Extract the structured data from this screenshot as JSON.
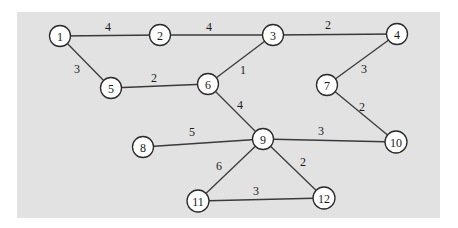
{
  "diagram": {
    "type": "weighted-undirected-graph",
    "colors": {
      "background": "#e2e2e2",
      "node_fill": "#ffffff",
      "stroke": "#2a2a2a"
    },
    "nodes": [
      {
        "id": "1",
        "label": "1",
        "x": 60,
        "y": 36
      },
      {
        "id": "2",
        "label": "2",
        "x": 160,
        "y": 35
      },
      {
        "id": "3",
        "label": "3",
        "x": 273,
        "y": 35
      },
      {
        "id": "4",
        "label": "4",
        "x": 397,
        "y": 34
      },
      {
        "id": "5",
        "label": "5",
        "x": 111,
        "y": 88
      },
      {
        "id": "6",
        "label": "6",
        "x": 208,
        "y": 84
      },
      {
        "id": "7",
        "label": "7",
        "x": 327,
        "y": 85
      },
      {
        "id": "8",
        "label": "8",
        "x": 143,
        "y": 147
      },
      {
        "id": "9",
        "label": "9",
        "x": 263,
        "y": 139
      },
      {
        "id": "10",
        "label": "10",
        "x": 396,
        "y": 142
      },
      {
        "id": "11",
        "label": "11",
        "x": 198,
        "y": 201
      },
      {
        "id": "12",
        "label": "12",
        "x": 324,
        "y": 198
      }
    ],
    "edges": [
      {
        "from": "1",
        "to": "2",
        "weight": "4",
        "lx": 108,
        "ly": 27
      },
      {
        "from": "2",
        "to": "3",
        "weight": "4",
        "lx": 209,
        "ly": 27
      },
      {
        "from": "3",
        "to": "4",
        "weight": "2",
        "lx": 328,
        "ly": 25
      },
      {
        "from": "1",
        "to": "5",
        "weight": "3",
        "lx": 77,
        "ly": 69
      },
      {
        "from": "5",
        "to": "6",
        "weight": "2",
        "lx": 154,
        "ly": 78
      },
      {
        "from": "6",
        "to": "3",
        "weight": "1",
        "lx": 243,
        "ly": 70
      },
      {
        "from": "4",
        "to": "7",
        "weight": "3",
        "lx": 364,
        "ly": 69
      },
      {
        "from": "7",
        "to": "10",
        "weight": "2",
        "lx": 362,
        "ly": 107
      },
      {
        "from": "6",
        "to": "9",
        "weight": "4",
        "lx": 240,
        "ly": 105
      },
      {
        "from": "8",
        "to": "9",
        "weight": "5",
        "lx": 192,
        "ly": 132
      },
      {
        "from": "9",
        "to": "10",
        "weight": "3",
        "lx": 321,
        "ly": 131
      },
      {
        "from": "9",
        "to": "11",
        "weight": "6",
        "lx": 219,
        "ly": 166
      },
      {
        "from": "9",
        "to": "12",
        "weight": "2",
        "lx": 303,
        "ly": 162
      },
      {
        "from": "11",
        "to": "12",
        "weight": "3",
        "lx": 256,
        "ly": 191
      }
    ]
  }
}
